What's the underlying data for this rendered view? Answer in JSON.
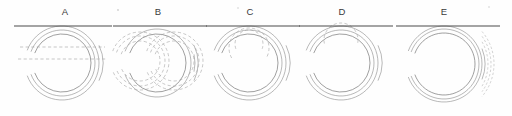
{
  "figure": {
    "background_color": "#fefefe",
    "width": 512,
    "height": 116,
    "line_color": "#4a4a4a",
    "contour_color": "#8d8d8d",
    "dashed_color": "#a2a2a2"
  },
  "panels": [
    {
      "label": "A",
      "label_x": 65,
      "label_y": 15,
      "center_x": 62,
      "center_y": 63,
      "ground_y": 26,
      "ground_x1": 14,
      "ground_x2": 112,
      "solid_radii": [
        29,
        33,
        37,
        41
      ],
      "dashed_radii": [],
      "inner_dashed_arcs": [],
      "dashed_h_lines": [
        {
          "y": 47,
          "x1": 20,
          "x2": 105
        },
        {
          "y": 59,
          "x1": 18,
          "x2": 106
        }
      ]
    },
    {
      "label": "B",
      "label_x": 158,
      "label_y": 15,
      "center_x": 157,
      "center_y": 63,
      "ground_y": 26,
      "ground_x1": 113,
      "ground_x2": 207,
      "solid_radii": [
        29,
        34,
        38,
        41
      ],
      "dashed_radii": [],
      "split_offsets": [
        -17,
        17
      ],
      "split_radii": [
        20,
        25,
        29
      ],
      "dashed_h_lines": []
    },
    {
      "label": "C",
      "label_x": 250,
      "label_y": 15,
      "center_x": 249,
      "center_y": 63,
      "ground_y": 26,
      "ground_x1": 206,
      "ground_x2": 300,
      "solid_radii": [
        29,
        33,
        37,
        41
      ],
      "dashed_radii": [],
      "inner_dashed_arcs": [
        {
          "cx": 249,
          "cy": 48,
          "r": 20,
          "a1": 150,
          "a2": 390
        },
        {
          "cx": 249,
          "cy": 44,
          "r": 14,
          "a1": 160,
          "a2": 380
        }
      ],
      "dashed_h_lines": []
    },
    {
      "label": "D",
      "label_x": 342,
      "label_y": 15,
      "center_x": 341,
      "center_y": 63,
      "ground_y": 26,
      "ground_x1": 299,
      "ground_x2": 393,
      "solid_radii": [
        29,
        33,
        37,
        41
      ],
      "dashed_radii": [],
      "inner_dashed_arcs": [
        {
          "cx": 341,
          "cy": 40,
          "r": 17,
          "a1": 168,
          "a2": 372
        }
      ],
      "dashed_h_lines": []
    },
    {
      "label": "E",
      "label_x": 444,
      "label_y": 15,
      "center_x": 444,
      "center_y": 64,
      "ground_y": 26,
      "ground_x1": 396,
      "ground_x2": 500,
      "solid_radii": [
        31,
        35,
        38,
        41
      ],
      "dashed_radii": [
        44,
        47,
        50
      ],
      "inner_dashed_arcs": [],
      "dashed_h_lines": []
    }
  ],
  "specks": [
    {
      "x": 118,
      "y": 10,
      "r": 0.9
    },
    {
      "x": 238,
      "y": 8,
      "r": 0.8
    },
    {
      "x": 489,
      "y": 7,
      "r": 0.8
    }
  ]
}
